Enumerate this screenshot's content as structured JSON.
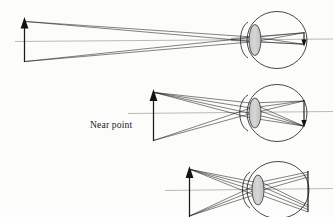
{
  "figure": {
    "background_color": "#fcfcfa",
    "ink_color": "#1a1a1a",
    "axis_color": "#8d8d8d",
    "lens_fill_color": "#cfcfcf",
    "width": 333,
    "height": 217
  },
  "labels": {
    "near_point": "Near point"
  },
  "panels": [
    {
      "id": "panel-distant-object",
      "name": "distant-object-relaxed-eye",
      "object_label": "",
      "object_x": 24,
      "object_top_y": 20,
      "object_bottom_y": 62,
      "axis_y": 41,
      "axis_start_x": 15,
      "axis_end_x": 333,
      "eye_center_x": 277,
      "eye_center_y": 40,
      "eye_rx": 30,
      "eye_ry": 29,
      "lens_x": 255,
      "lens_ry": 16,
      "lens_rx": 6,
      "retina_x": 304,
      "ray_count": 2
    },
    {
      "id": "panel-near-point",
      "name": "near-point-object-accommodated-eye",
      "object_label": "Near point",
      "object_x": 153,
      "object_top_y": 90,
      "object_bottom_y": 141,
      "axis_y": 113,
      "axis_start_x": 128,
      "axis_end_x": 333,
      "eye_center_x": 277,
      "eye_center_y": 113,
      "eye_rx": 30,
      "eye_ry": 29,
      "lens_x": 255,
      "lens_ry": 15,
      "lens_rx": 6,
      "retina_x": 304,
      "ray_count": 3,
      "label_x": 90,
      "label_y": 128
    },
    {
      "id": "panel-closer-than-near-point",
      "name": "object-inside-near-point-blurred",
      "object_label": "",
      "object_x": 189,
      "object_top_y": 165,
      "object_bottom_y": 217,
      "axis_y": 190,
      "axis_start_x": 165,
      "axis_end_x": 333,
      "eye_center_x": 277,
      "eye_center_y": 190,
      "eye_rx": 30,
      "eye_ry": 29,
      "lens_x": 258,
      "lens_ry": 15,
      "lens_rx": 6,
      "retina_x": 306,
      "ray_count": 3
    }
  ],
  "legend": {
    "object_name": "object-arrow",
    "lens_name": "crystalline-lens",
    "retina_name": "retina-image-marker",
    "axis_name": "optical-axis"
  }
}
